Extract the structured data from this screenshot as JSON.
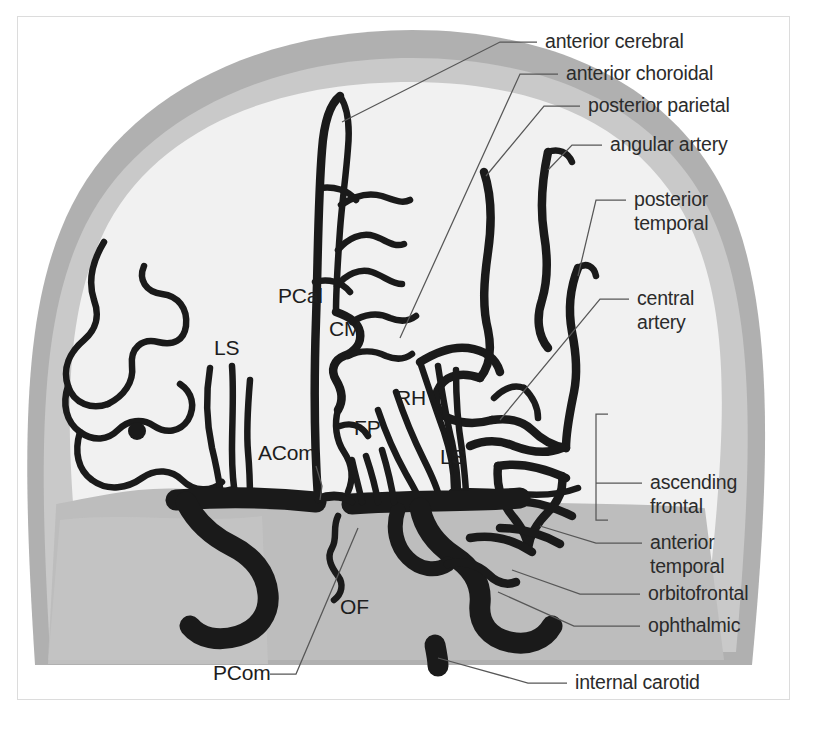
{
  "figure": {
    "view": "anteroposterior (AP) internal carotid angiogram schematic"
  },
  "colors": {
    "background": "#ffffff",
    "border": "#dcdcdc",
    "skull_outer_band": "#b0b0b0",
    "skull_inner_band": "#c8c8c8",
    "brain_interior": "#f0f0f0",
    "skull_base": "#bdbdbd",
    "vessel": "#1a1a1a",
    "leader_line": "#575757",
    "label_text": "#2b2b2b"
  },
  "callout_labels": [
    {
      "id": "anterior-cerebral",
      "text": "anterior cerebral",
      "x": 545,
      "y": 48,
      "anchor": "start",
      "lines": 1
    },
    {
      "id": "anterior-choroidal",
      "text": "anterior choroidal",
      "x": 566,
      "y": 80,
      "anchor": "start",
      "lines": 1
    },
    {
      "id": "posterior-parietal",
      "text": "posterior parietal",
      "x": 588,
      "y": 112,
      "anchor": "start",
      "lines": 1
    },
    {
      "id": "angular-artery",
      "text": "angular artery",
      "x": 610,
      "y": 151,
      "anchor": "start",
      "lines": 1
    },
    {
      "id": "posterior-temporal",
      "text": "posterior temporal",
      "x": 634,
      "y": 206,
      "anchor": "start",
      "lines": 2,
      "line1": "posterior",
      "line2": "temporal"
    },
    {
      "id": "central-artery",
      "text": "central artery",
      "x": 637,
      "y": 305,
      "anchor": "start",
      "lines": 2,
      "line1": "central",
      "line2": "artery"
    },
    {
      "id": "ascending-frontal",
      "text": "ascending frontal",
      "x": 650,
      "y": 489,
      "anchor": "start",
      "lines": 2,
      "line1": "ascending",
      "line2": "frontal"
    },
    {
      "id": "anterior-temporal",
      "text": "anterior temporal",
      "x": 650,
      "y": 549,
      "anchor": "start",
      "lines": 2,
      "line1": "anterior",
      "line2": "temporal"
    },
    {
      "id": "orbitofrontal",
      "text": "orbitofrontal",
      "x": 648,
      "y": 600,
      "anchor": "start",
      "lines": 1
    },
    {
      "id": "ophthalmic",
      "text": "ophthalmic",
      "x": 648,
      "y": 632,
      "anchor": "start",
      "lines": 1
    },
    {
      "id": "internal-carotid",
      "text": "internal carotid",
      "x": 575,
      "y": 689,
      "anchor": "start",
      "lines": 1
    },
    {
      "id": "pcom",
      "text": "PCom",
      "x": 213,
      "y": 680,
      "anchor": "start",
      "lines": 1
    }
  ],
  "inline_labels": [
    {
      "id": "pcal",
      "text": "PCal",
      "x": 278,
      "y": 303
    },
    {
      "id": "cm",
      "text": "CM",
      "x": 329,
      "y": 336
    },
    {
      "id": "ls-left",
      "text": "LS",
      "x": 214,
      "y": 355
    },
    {
      "id": "rh",
      "text": "RH",
      "x": 396,
      "y": 405
    },
    {
      "id": "fp",
      "text": "FP",
      "x": 354,
      "y": 435
    },
    {
      "id": "acom",
      "text": "ACom",
      "x": 258,
      "y": 460
    },
    {
      "id": "ls-right",
      "text": "LS",
      "x": 440,
      "y": 464
    },
    {
      "id": "of",
      "text": "OF",
      "x": 340,
      "y": 614
    }
  ],
  "anatomy_structures": {
    "skull": "lateral cranial vault outline with two-tone gray cortical band",
    "midline": "vertical anterior cerebral artery ascending along the midline",
    "left_hemisphere_vessels": "callosomarginal and pericallosal branches with cortical loops",
    "right_hemisphere_vessels": "middle cerebral artery candelabra: angular, posterior parietal, posterior temporal, central and ascending frontal branches",
    "base_vessels": "internal carotid arteries ascending bilaterally into the carotid siphon with ophthalmic, posterior communicating and anterior communicating connections"
  }
}
